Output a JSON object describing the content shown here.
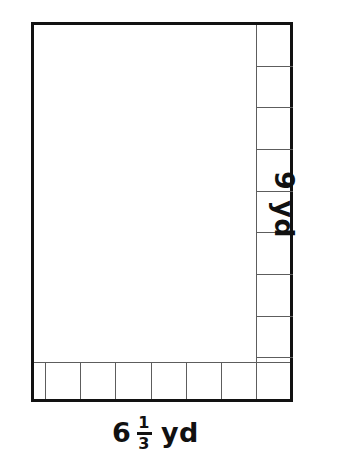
{
  "figure": {
    "type": "area-model-rectangle",
    "stroke_color": "#121212",
    "grid_color": "#5d5d5d",
    "fill_color": "#ffffff"
  },
  "labels": {
    "bottom": {
      "whole": "6",
      "numerator": "1",
      "denominator": "3",
      "unit": "yd",
      "full_text": "6 1/3 yd"
    },
    "right": {
      "value": "9",
      "unit": "yd",
      "full_text": "9 yd",
      "rotation_degrees": 90
    }
  },
  "chart_data": {
    "type": "area-model",
    "title": "",
    "width_value": 6.3333,
    "width_label": "6 1/3 yd",
    "height_value": 9,
    "height_label": "9 yd",
    "units": "yd",
    "right_column_cells": 9,
    "bottom_row_full_cells": 6,
    "bottom_row_partial_cells": 1,
    "bottom_row_partial_fraction": "1/3"
  },
  "grid": {
    "right_column": [
      {
        "index": 1
      },
      {
        "index": 2
      },
      {
        "index": 3
      },
      {
        "index": 4
      },
      {
        "index": 5
      },
      {
        "index": 6
      },
      {
        "index": 7
      },
      {
        "index": 8
      },
      {
        "index": 9
      }
    ],
    "bottom_row": [
      {
        "index": 1,
        "kind": "partial"
      },
      {
        "index": 2,
        "kind": "full"
      },
      {
        "index": 3,
        "kind": "full"
      },
      {
        "index": 4,
        "kind": "full"
      },
      {
        "index": 5,
        "kind": "full"
      },
      {
        "index": 6,
        "kind": "full"
      },
      {
        "index": 7,
        "kind": "full"
      }
    ]
  }
}
